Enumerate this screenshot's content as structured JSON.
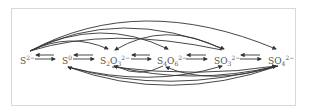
{
  "diagram": {
    "title": "",
    "stroke_color": "#333333",
    "frame_color": "#d8d8d8",
    "species": [
      {
        "id": "s2minus",
        "base": "S",
        "sub": "",
        "charge": "2−",
        "x": 20
      },
      {
        "id": "s0",
        "base": "S",
        "sub": "",
        "charge": "0",
        "x": 64
      },
      {
        "id": "s2o3",
        "base": "S",
        "sub": "2",
        "base2": "O",
        "sub2": "3",
        "charge": "2−",
        "x": 101
      },
      {
        "id": "s4o6",
        "base": "S",
        "sub": "4",
        "base2": "O",
        "sub2": "6",
        "charge": "2−",
        "x": 159
      },
      {
        "id": "so3",
        "base": "SO",
        "sub": "3",
        "charge": "2−",
        "x": 215
      },
      {
        "id": "so4",
        "base": "SO",
        "sub": "4",
        "charge": "2−",
        "x": 270
      }
    ],
    "edges": [
      {
        "from": "S2-",
        "to": "S0",
        "type": "reversible"
      },
      {
        "from": "S0",
        "to": "S2O3 2-",
        "type": "reversible"
      },
      {
        "from": "S2O3 2-",
        "to": "S4O6 2-",
        "type": "reversible"
      },
      {
        "from": "S4O6 2-",
        "to": "SO3 2-",
        "type": "reversible"
      },
      {
        "from": "SO3 2-",
        "to": "SO4 2-",
        "type": "reversible"
      },
      {
        "from": "S2-",
        "to": "S2O3 2-",
        "type": "arc-above"
      },
      {
        "from": "S2-",
        "to": "S4O6 2-",
        "type": "arc-above"
      },
      {
        "from": "S2-",
        "to": "SO3 2-",
        "type": "arc-above"
      },
      {
        "from": "S2-",
        "to": "SO4 2-",
        "type": "arc-above"
      },
      {
        "from": "SO3 2-",
        "to": "S2O3 2-",
        "type": "arc-above"
      },
      {
        "from": "SO4 2-",
        "to": "S0",
        "type": "arc-below"
      },
      {
        "from": "S0",
        "to": "SO4 2-",
        "type": "arc-below"
      },
      {
        "from": "S0",
        "to": "SO3 2-",
        "type": "arc-below"
      },
      {
        "from": "S4O6 2-",
        "to": "S2O3 2-",
        "type": "arc-below"
      },
      {
        "from": "S2O3 2-",
        "to": "SO4 2-",
        "type": "arc-below"
      },
      {
        "from": "SO4 2-",
        "to": "S4O6 2-",
        "type": "arc-below"
      }
    ]
  }
}
